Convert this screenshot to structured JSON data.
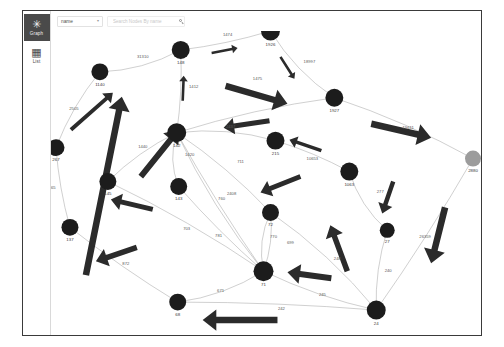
{
  "app": {
    "title": "Graph Explorer"
  },
  "sidebar": {
    "items": [
      {
        "id": "graph",
        "label": "Graph",
        "icon": "graph-icon",
        "glyph": "✳",
        "active": true
      },
      {
        "id": "list",
        "label": "List",
        "icon": "list-grid-icon",
        "glyph": "▦",
        "active": false
      }
    ]
  },
  "toolbar": {
    "attribute_select": {
      "value": "name",
      "caret": "▼"
    },
    "search": {
      "value": "",
      "placeholder": "Search Nodes By name",
      "icon": "search-icon"
    }
  },
  "graph": {
    "node_fill": "#1c1c1c",
    "node_fill_muted": "#9c9c9c",
    "edge_color": "#9f9f9f",
    "arrow_color": "#2b2b2b",
    "nodes": [
      {
        "id": "1140",
        "label": "1140",
        "x": 100,
        "y": 72,
        "r": 8.5,
        "muted": false
      },
      {
        "id": "148",
        "label": "148",
        "x": 181,
        "y": 50,
        "r": 9.0,
        "muted": false
      },
      {
        "id": "1926",
        "label": "1926",
        "x": 271,
        "y": 31,
        "r": 9.5,
        "muted": false
      },
      {
        "id": "1927",
        "label": "1927",
        "x": 335,
        "y": 98,
        "r": 9.0,
        "muted": false
      },
      {
        "id": "2880",
        "label": "2880",
        "x": 474,
        "y": 159,
        "r": 8.0,
        "muted": true
      },
      {
        "id": "142",
        "label": "142",
        "x": 177,
        "y": 133,
        "r": 9.5,
        "muted": false
      },
      {
        "id": "215",
        "label": "215",
        "x": 276,
        "y": 141,
        "r": 9.0,
        "muted": false
      },
      {
        "id": "1063",
        "label": "1063",
        "x": 350,
        "y": 172,
        "r": 9.0,
        "muted": false
      },
      {
        "id": "267",
        "label": "267",
        "x": 56,
        "y": 148,
        "r": 8.5,
        "muted": false
      },
      {
        "id": "145",
        "label": "145",
        "x": 108,
        "y": 182,
        "r": 8.5,
        "muted": false
      },
      {
        "id": "143",
        "label": "143",
        "x": 179,
        "y": 187,
        "r": 8.5,
        "muted": false
      },
      {
        "id": "137",
        "label": "137",
        "x": 70,
        "y": 228,
        "r": 8.5,
        "muted": false
      },
      {
        "id": "72",
        "label": "72",
        "x": 271,
        "y": 213,
        "r": 8.5,
        "muted": false
      },
      {
        "id": "27",
        "label": "27",
        "x": 388,
        "y": 231,
        "r": 7.5,
        "muted": false
      },
      {
        "id": "71",
        "label": "71",
        "x": 264,
        "y": 272,
        "r": 10.0,
        "muted": false
      },
      {
        "id": "68",
        "label": "68",
        "x": 178,
        "y": 303,
        "r": 8.5,
        "muted": false
      },
      {
        "id": "24",
        "label": "24",
        "x": 377,
        "y": 311,
        "r": 9.5,
        "muted": false
      }
    ],
    "edges": [
      {
        "from": "1140",
        "to": "148",
        "label": "31310",
        "lx": 143,
        "ly": 58
      },
      {
        "from": "267",
        "to": "1140",
        "label": "2505",
        "lx": 74,
        "ly": 110
      },
      {
        "from": "148",
        "to": "1926",
        "label": "1474",
        "lx": 228,
        "ly": 36
      },
      {
        "from": "1926",
        "to": "1927",
        "label": "18997",
        "lx": 310,
        "ly": 63
      },
      {
        "from": "142",
        "to": "1927",
        "label": "1475",
        "lx": 258,
        "ly": 80
      },
      {
        "from": "142",
        "to": "148",
        "label": "1412",
        "lx": 194,
        "ly": 88
      },
      {
        "from": "215",
        "to": "142",
        "label": "2437",
        "lx": 231,
        "ly": 128
      },
      {
        "from": "1927",
        "to": "2880",
        "label": "19611",
        "lx": 409,
        "ly": 129
      },
      {
        "from": "1063",
        "to": "215",
        "label": "10653",
        "lx": 313,
        "ly": 160
      },
      {
        "from": "1063",
        "to": "27",
        "label": "277",
        "lx": 381,
        "ly": 194
      },
      {
        "from": "145",
        "to": "142",
        "label": "1440",
        "lx": 143,
        "ly": 148
      },
      {
        "from": "267",
        "to": "137",
        "label": "1365",
        "lx": 51,
        "ly": 190
      },
      {
        "from": "142",
        "to": "143",
        "label": "1420",
        "lx": 190,
        "ly": 156
      },
      {
        "from": "142",
        "to": "72",
        "label": "711",
        "lx": 241,
        "ly": 163
      },
      {
        "from": "142",
        "to": "71",
        "label": "2408",
        "lx": 232,
        "ly": 196
      },
      {
        "from": "142",
        "to": "71",
        "label": "760",
        "lx": 222,
        "ly": 201
      },
      {
        "from": "145",
        "to": "71",
        "label": "703",
        "lx": 187,
        "ly": 231
      },
      {
        "from": "143",
        "to": "71",
        "label": "781",
        "lx": 219,
        "ly": 238
      },
      {
        "from": "72",
        "to": "71",
        "label": "770",
        "lx": 274,
        "ly": 239
      },
      {
        "from": "72",
        "to": "71",
        "label": "699",
        "lx": 291,
        "ly": 245
      },
      {
        "from": "137",
        "to": "68",
        "label": "872",
        "lx": 126,
        "ly": 266
      },
      {
        "from": "68",
        "to": "71",
        "label": "671",
        "lx": 221,
        "ly": 293
      },
      {
        "from": "24",
        "to": "71",
        "label": "245",
        "lx": 323,
        "ly": 297
      },
      {
        "from": "24",
        "to": "68",
        "label": "242",
        "lx": 282,
        "ly": 311
      },
      {
        "from": "24",
        "to": "72",
        "label": "248",
        "lx": 338,
        "ly": 261
      },
      {
        "from": "24",
        "to": "27",
        "label": "240",
        "lx": 389,
        "ly": 273
      },
      {
        "from": "24",
        "to": "2880",
        "label": "26359",
        "lx": 426,
        "ly": 239
      }
    ],
    "flow_arrows": [
      {
        "x1": 86,
        "y1": 276,
        "x2": 122,
        "y2": 97,
        "w": 6.5
      },
      {
        "x1": 71,
        "y1": 130,
        "x2": 113,
        "y2": 93,
        "w": 4.0
      },
      {
        "x1": 141,
        "y1": 177,
        "x2": 179,
        "y2": 130,
        "w": 6.0
      },
      {
        "x1": 183,
        "y1": 101,
        "x2": 184,
        "y2": 76,
        "w": 2.6
      },
      {
        "x1": 212,
        "y1": 53,
        "x2": 238,
        "y2": 48,
        "w": 2.6
      },
      {
        "x1": 281,
        "y1": 57,
        "x2": 295,
        "y2": 79,
        "w": 2.6
      },
      {
        "x1": 226,
        "y1": 86,
        "x2": 288,
        "y2": 104,
        "w": 6.5
      },
      {
        "x1": 270,
        "y1": 121,
        "x2": 224,
        "y2": 128,
        "w": 5.0
      },
      {
        "x1": 322,
        "y1": 151,
        "x2": 290,
        "y2": 140,
        "w": 3.6
      },
      {
        "x1": 372,
        "y1": 124,
        "x2": 432,
        "y2": 138,
        "w": 6.5
      },
      {
        "x1": 446,
        "y1": 208,
        "x2": 432,
        "y2": 264,
        "w": 6.5
      },
      {
        "x1": 394,
        "y1": 182,
        "x2": 383,
        "y2": 214,
        "w": 4.5
      },
      {
        "x1": 301,
        "y1": 177,
        "x2": 261,
        "y2": 193,
        "w": 5.0
      },
      {
        "x1": 348,
        "y1": 272,
        "x2": 331,
        "y2": 226,
        "w": 5.5
      },
      {
        "x1": 332,
        "y1": 279,
        "x2": 288,
        "y2": 273,
        "w": 6.0
      },
      {
        "x1": 153,
        "y1": 210,
        "x2": 111,
        "y2": 200,
        "w": 5.0
      },
      {
        "x1": 137,
        "y1": 248,
        "x2": 96,
        "y2": 262,
        "w": 5.5
      },
      {
        "x1": 278,
        "y1": 321,
        "x2": 203,
        "y2": 321,
        "w": 6.5
      }
    ]
  }
}
